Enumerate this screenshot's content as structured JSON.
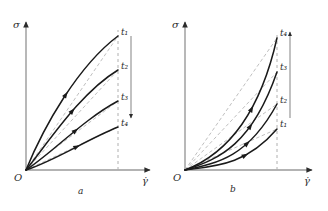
{
  "figure": {
    "panels": [
      {
        "id": "a",
        "caption": "a",
        "caption_x": 78,
        "caption_y": 186,
        "origin_label": "O",
        "y_axis_label": "σ",
        "x_axis_label": "γ̇",
        "trend_arrow": "down",
        "axes": {
          "ox": 26,
          "oy": 170,
          "x_end": 150,
          "y_top": 22
        },
        "plateau_x": 118,
        "trend_line": {
          "x": 131,
          "y_top": 36,
          "y_bottom": 118
        },
        "curve_labels": [
          "t₁",
          "t₂",
          "t₃",
          "t₄"
        ],
        "curves": [
          {
            "label": "t₁",
            "label_x": 121,
            "label_y": 31,
            "end_y": 36,
            "path": "M 26 170 C 44 126 78 66 118 36",
            "secant": "M 26 170 L 118 36",
            "marker_t": 0.52
          },
          {
            "label": "t₂",
            "label_x": 121,
            "label_y": 65,
            "end_y": 70,
            "path": "M 26 170 C 48 143 80 93 118 70",
            "secant": "M 26 170 L 118 70",
            "marker_t": 0.55
          },
          {
            "label": "t₃",
            "label_x": 121,
            "label_y": 96,
            "end_y": 101,
            "path": "M 26 170 C 52 153 84 119 118 101",
            "secant": "M 26 170 L 118 101",
            "marker_t": 0.55
          },
          {
            "label": "t₄",
            "label_x": 121,
            "label_y": 122,
            "end_y": 127,
            "path": "M 26 170 C 56 160 86 140 118 127",
            "secant": "M 26 170 L 118 127",
            "marker_t": 0.55
          }
        ]
      },
      {
        "id": "b",
        "caption": "b",
        "caption_x": 230,
        "caption_y": 184,
        "origin_label": "O",
        "y_axis_label": "σ",
        "x_axis_label": "γ̇",
        "trend_arrow": "up",
        "axes": {
          "ox": 185,
          "oy": 170,
          "x_end": 312,
          "y_top": 22
        },
        "plateau_x": 277,
        "trend_line": {
          "x": 290,
          "y_top": 32,
          "y_bottom": 118
        },
        "curve_labels": [
          "t₄",
          "t₃",
          "t₂",
          "t₁"
        ],
        "curves": [
          {
            "label": "t₄",
            "label_x": 280,
            "label_y": 32,
            "end_y": 38,
            "path": "M 185 170 C 222 156 258 122 277 38",
            "secant": "M 185 170 L 277 38",
            "marker_t": 0.55
          },
          {
            "label": "t₃",
            "label_x": 280,
            "label_y": 66,
            "end_y": 72,
            "path": "M 185 170 C 220 159 252 144 277 72",
            "secant": "M 185 170 L 277 72",
            "marker_t": 0.57
          },
          {
            "label": "t₂",
            "label_x": 280,
            "label_y": 99,
            "end_y": 104,
            "path": "M 185 170 C 218 163 248 157 277 104",
            "secant": "M 185 170 L 277 104",
            "marker_t": 0.58
          },
          {
            "label": "t₁",
            "label_x": 280,
            "label_y": 123,
            "end_y": 129,
            "path": "M 185 170 C 216 166 246 165 277 129",
            "secant": "M 185 170 L 277 129",
            "marker_t": 0.6
          }
        ]
      }
    ],
    "colors": {
      "axis": "#9a9a9a",
      "curve": "#1a1a1a",
      "secant": "#b8b8b8",
      "dashed_vertical": "#b0b0b0",
      "trend": "#8e8e8e",
      "text": "#2b2b2b"
    }
  }
}
